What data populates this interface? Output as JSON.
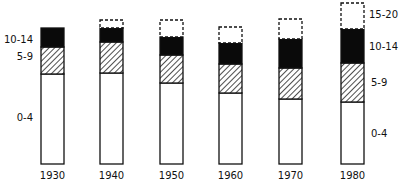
{
  "chart_data": {
    "type": "bar",
    "stacked": true,
    "title": "",
    "xlabel": "",
    "ylabel": "",
    "categories": [
      "1930",
      "1940",
      "1950",
      "1960",
      "1970",
      "1980"
    ],
    "series": [
      {
        "name": "0-4",
        "fill": "white",
        "values": [
          90,
          91,
          81,
          71,
          65,
          62
        ]
      },
      {
        "name": "5-9",
        "fill": "hatched",
        "values": [
          27,
          31,
          28,
          29,
          31,
          39
        ]
      },
      {
        "name": "10-14",
        "fill": "black",
        "values": [
          19,
          14,
          18,
          21,
          29,
          34
        ]
      },
      {
        "name": "15-20",
        "fill": "dashed-outline",
        "values": [
          0,
          8,
          17,
          16,
          20,
          26
        ]
      }
    ],
    "units": "relative bar height (pixels, no axis shown)",
    "grid": false,
    "legend": "inline labels beside first (1930) and last (1980) bars"
  },
  "labels": {
    "left": {
      "age_10_14": "10-14",
      "age_5_9": "5-9",
      "age_0_4": "0-4"
    },
    "right": {
      "age_15_20": "15-20",
      "age_10_14": "10-14",
      "age_5_9": "5-9",
      "age_0_4": "0-4"
    }
  }
}
